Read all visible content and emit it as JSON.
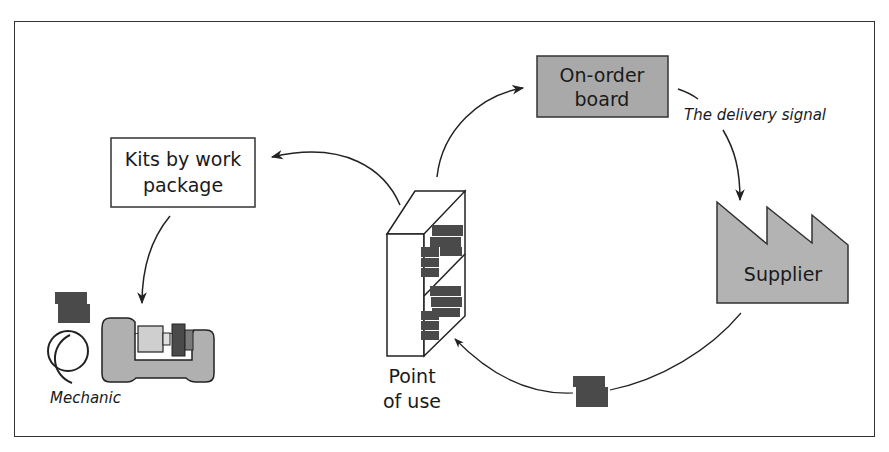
{
  "diagram": {
    "nodes": {
      "on_order_board": {
        "line1": "On-order",
        "line2": "board"
      },
      "kits": {
        "line1": "Kits by work",
        "line2": "package"
      },
      "supplier": {
        "label": "Supplier"
      },
      "point_of_use": {
        "line1": "Point",
        "line2": "of use"
      },
      "mechanic": {
        "label": "Mechanic"
      }
    },
    "edges": [
      {
        "from": "point_of_use",
        "to": "on_order_board",
        "label": ""
      },
      {
        "from": "on_order_board",
        "to": "supplier",
        "label": "The delivery signal"
      },
      {
        "from": "supplier",
        "to": "point_of_use",
        "label": ""
      },
      {
        "from": "point_of_use",
        "to": "kits",
        "label": ""
      },
      {
        "from": "kits",
        "to": "mechanic",
        "label": ""
      }
    ],
    "colors": {
      "box_fill": "#a9a9a9",
      "supplier_fill": "#b3b3b3",
      "part_fill": "#4a4a4a",
      "machine_fill": "#b0b0b0",
      "machine_light": "#cfcfcf",
      "stroke": "#222222"
    }
  }
}
